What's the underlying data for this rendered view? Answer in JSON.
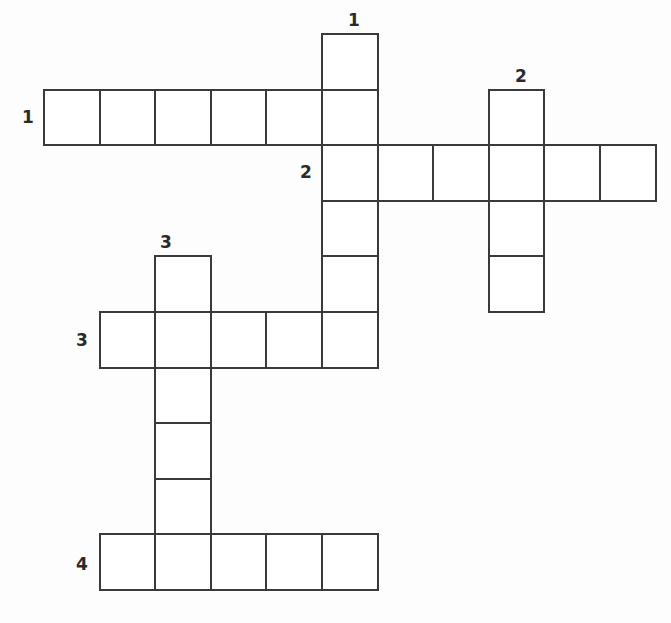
{
  "puzzle": {
    "type": "crossword",
    "cell_size": 55.6,
    "origin": {
      "x": 44,
      "y": 34
    },
    "clue_numbers": [
      {
        "label": "1",
        "direction": "down",
        "x": 348,
        "y": 12
      },
      {
        "label": "1",
        "direction": "across",
        "x": 22,
        "y": 109
      },
      {
        "label": "2",
        "direction": "down",
        "x": 515,
        "y": 68
      },
      {
        "label": "2",
        "direction": "across",
        "x": 300,
        "y": 164
      },
      {
        "label": "3",
        "direction": "down",
        "x": 160,
        "y": 234
      },
      {
        "label": "3",
        "direction": "across",
        "x": 76,
        "y": 332
      },
      {
        "label": "4",
        "direction": "across",
        "x": 76,
        "y": 556
      }
    ],
    "words": [
      {
        "id": "1-across",
        "number": 1,
        "direction": "across",
        "row": 1,
        "col": 0,
        "length": 6
      },
      {
        "id": "1-down",
        "number": 1,
        "direction": "down",
        "row": 0,
        "col": 5,
        "length": 6
      },
      {
        "id": "2-across",
        "number": 2,
        "direction": "across",
        "row": 2,
        "col": 5,
        "length": 6
      },
      {
        "id": "2-down",
        "number": 2,
        "direction": "down",
        "row": 1,
        "col": 8,
        "length": 4
      },
      {
        "id": "3-down",
        "number": 3,
        "direction": "down",
        "row": 4,
        "col": 2,
        "length": 6
      },
      {
        "id": "3-across",
        "number": 3,
        "direction": "across",
        "row": 5,
        "col": 1,
        "length": 5
      },
      {
        "id": "4-across",
        "number": 4,
        "direction": "across",
        "row": 9,
        "col": 1,
        "length": 5
      }
    ],
    "cells": [
      [
        0,
        5
      ],
      [
        1,
        0
      ],
      [
        1,
        1
      ],
      [
        1,
        2
      ],
      [
        1,
        3
      ],
      [
        1,
        4
      ],
      [
        1,
        5
      ],
      [
        1,
        8
      ],
      [
        2,
        5
      ],
      [
        2,
        6
      ],
      [
        2,
        7
      ],
      [
        2,
        8
      ],
      [
        2,
        9
      ],
      [
        2,
        10
      ],
      [
        3,
        5
      ],
      [
        3,
        8
      ],
      [
        4,
        2
      ],
      [
        4,
        5
      ],
      [
        4,
        8
      ],
      [
        5,
        1
      ],
      [
        5,
        2
      ],
      [
        5,
        3
      ],
      [
        5,
        4
      ],
      [
        5,
        5
      ],
      [
        6,
        2
      ],
      [
        7,
        2
      ],
      [
        8,
        2
      ],
      [
        9,
        1
      ],
      [
        9,
        2
      ],
      [
        9,
        3
      ],
      [
        9,
        4
      ],
      [
        9,
        5
      ]
    ]
  },
  "colors": {
    "grid_line": "#3a3a3a",
    "background": "#fdfdfd",
    "cell_fill": "#ffffff",
    "number": "#2a2a2a"
  }
}
